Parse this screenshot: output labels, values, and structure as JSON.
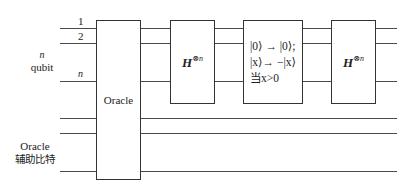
{
  "diagram": {
    "type": "quantum-circuit",
    "qubit_group": {
      "label_n": "n",
      "label_qubit": "qubit",
      "wire_labels": [
        "1",
        "2",
        "n"
      ]
    },
    "ancilla_group": {
      "label_line1": "Oracle",
      "label_line2": "辅助比特"
    },
    "gates": [
      {
        "id": "oracle",
        "label": "Oracle",
        "spans": "all wires"
      },
      {
        "id": "hadamard-1",
        "base": "H",
        "superscript": "⊗n",
        "spans": "qubit wires"
      },
      {
        "id": "conditional-phase",
        "lines": [
          "|0⟩ → |0⟩;",
          "|x⟩→ −|x⟩",
          "当x>0"
        ],
        "spans": "qubit wires"
      },
      {
        "id": "hadamard-2",
        "base": "H",
        "superscript": "⊗n",
        "spans": "qubit wires"
      }
    ]
  }
}
